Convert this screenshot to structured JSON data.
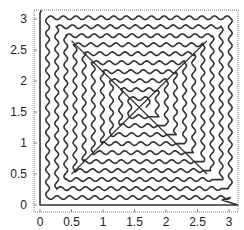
{
  "chart_data": {
    "type": "line",
    "title": "",
    "xlabel": "",
    "ylabel": "",
    "xlim": [
      -0.05,
      3.2
    ],
    "ylim": [
      -0.1,
      3.2
    ],
    "grid": false,
    "legend": null,
    "x_ticks": [
      "0",
      "0.5",
      "1",
      "1.5",
      "2",
      "2.5",
      "3"
    ],
    "y_ticks": [
      "0",
      "0.5",
      "1",
      "1.5",
      "2",
      "2.5",
      "3"
    ],
    "series": [
      {
        "name": "wavy square spiral path",
        "description": "Single continuous curve starting near (0, 3.14), running straight down the left edge to (0,0), along the bottom to (3.14,0), then spiraling inward in nested wavy square loops whose diagonal crossings form a lattice; approx. 10 concentric wavy loops.",
        "color": "#333333",
        "loops": 10,
        "wave_amplitude": 0.03,
        "wave_period": 0.2
      }
    ]
  },
  "axes": {
    "x_tick_labels": [
      "0",
      "0.5",
      "1",
      "1.5",
      "2",
      "2.5",
      "3"
    ],
    "y_tick_labels": [
      "0",
      "0.5",
      "1",
      "1.5",
      "2",
      "2.5",
      "3"
    ]
  }
}
